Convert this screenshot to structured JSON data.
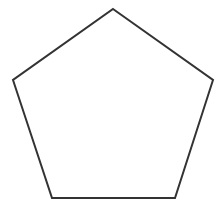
{
  "diagram": {
    "shape": "pentagon",
    "stroke_color": "#333333",
    "fill_color": "#ffffff",
    "stroke_width": 2,
    "vertices": [
      [
        113,
        9
      ],
      [
        213,
        80
      ],
      [
        175,
        198
      ],
      [
        52,
        198
      ],
      [
        13,
        80
      ]
    ]
  }
}
